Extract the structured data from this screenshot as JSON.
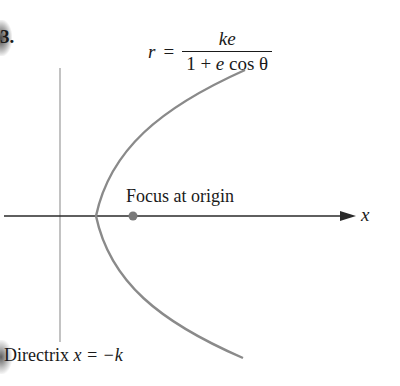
{
  "problem_number": "3.",
  "formula": {
    "lhs": "r",
    "equals": "=",
    "numerator": "ke",
    "denominator_prefix": "1 + ",
    "denominator_var": "e",
    "denominator_suffix": " cos θ"
  },
  "labels": {
    "focus": "Focus at origin",
    "axis": "x",
    "directrix_text": "Directrix ",
    "directrix_eq": "x = −k"
  },
  "colors": {
    "curve": "#8a8a8a",
    "axis": "#2a2a2a",
    "directrix": "#9a9a9a",
    "focus": "#7a7a7a",
    "text": "#1a1a1a"
  },
  "geometry": {
    "axis_y": 216,
    "axis_x_start": 4,
    "axis_x_end": 356,
    "directrix_x": 60,
    "directrix_y_top": 68,
    "directrix_y_bottom": 342,
    "focus_cx": 133,
    "focus_cy": 216,
    "vertex_x": 96
  }
}
